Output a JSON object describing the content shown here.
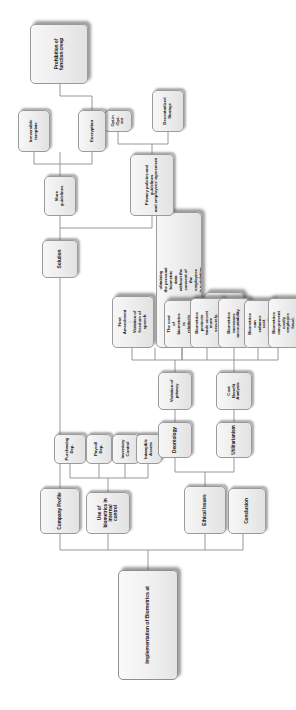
{
  "diagram": {
    "title": "Implementation of Biometrics at",
    "type": "organizational-tree",
    "orientation": "rotated-90-ccw",
    "background_color": "#ffffff",
    "node_fill": "#ececed",
    "node_border": "#9a9a9a",
    "connector_color": "#8d8d8d",
    "nodes": {
      "root": "Implementation of Biometrics at",
      "company_profile": "Company Profile",
      "use_of_biometrics": "Use of\nbiometrics in\ninternal\ncontrol",
      "purchasing_dep": "Purchasing\nDep.",
      "payroll_dep": "Payroll\nDep.",
      "inventory_control": "Inventory\nControl",
      "intangible_assets": "Intangible\nAssets",
      "ethical_issues": "Ethical Issues",
      "conclusion": "Conclusion",
      "utilitarianism": "Utilitarianism",
      "cost_benefit_analysis": "Cost\nBenefit\nAnalysis",
      "prevent_fraud": "Biometrics\ncan prevent\ncostly\nemployee\nfraud.",
      "cost_accounting": "Biometrics\ncan\nenhance\ncost\naccounting.",
      "accountability": "Biometrics\nincreases\naccountability.",
      "trade_secret": "Biometrics\nprotects\ntrade secret\nmore\nsecurely.",
      "low_cost": "The cost\nof\nbiometrics\nis\nrelatively\nlow",
      "deontology": "Deontology",
      "violation_of_privacy": "Violation of\nprivacy",
      "first_amendment": "First\nAmendment\n:\nViolation of\nfreedom of\nspeech",
      "third_amendment": "Third\nAmendment\n:\nobtaining\nthe personal\nbiometric\ndata\nwithout the\nconsent of\nthe\nemployees\nis a violation\nof the Third\nAmendment",
      "fourth_amendment": "Fourth\nAmendment\n:\nviolation of\nfreedom to\nfeel secure",
      "solution": "Solution",
      "privacy_policies": "Privacy policies and guidelines\nand employees' agreement",
      "opt_in_opt_out": "Opt-in\n/Opt-\nout",
      "decentralized_storage": "Decentralized\nStorage",
      "more_guidelines": "More\nguidelines",
      "encryption": "Encryption",
      "irreversible_template": "Irreversible\ntemplate",
      "prohibition_function_creep": "Prohibition of\nfunction creep"
    }
  }
}
